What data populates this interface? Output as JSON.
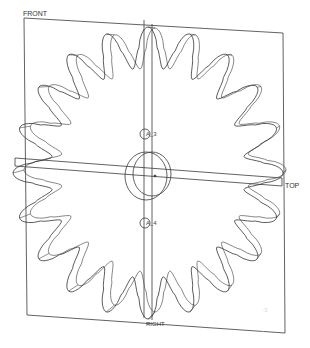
{
  "viewport": {
    "background": "#ffffff",
    "line_color": "#3a3a3a"
  },
  "model": {
    "type": "sprocket",
    "teeth": 20
  },
  "datum_planes": {
    "front": {
      "label": "FRONT"
    },
    "top": {
      "label": "TOP"
    },
    "right": {
      "label": "RIGHT"
    }
  },
  "datum_axes": [
    {
      "label": "A_3"
    },
    {
      "label": "A_4"
    }
  ],
  "faint_marks": [
    "-3",
    "-"
  ]
}
